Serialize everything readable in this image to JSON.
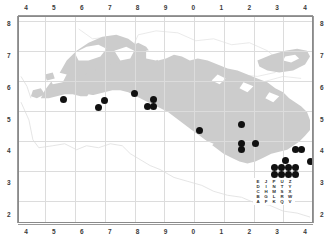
{
  "figure": {
    "kind": "distribution-dot-map",
    "background_color": "#ffffff",
    "landmass_color": "#cccccc",
    "coastline_color": "#d8d8d8",
    "grid_color": "#dcdcdc",
    "dot_color": "#111111",
    "frame_color": "#8a8a8a"
  },
  "axes": {
    "top_ticks": [
      "4",
      "5",
      "6",
      "7",
      "8",
      "9",
      "0",
      "1",
      "2",
      "3",
      "4"
    ],
    "bottom_ticks": [
      "4",
      "5",
      "6",
      "7",
      "8",
      "9",
      "0",
      "1",
      "2",
      "3",
      "4"
    ],
    "left_ticks": [
      "8",
      "7",
      "6",
      "5",
      "4",
      "3",
      "2"
    ],
    "right_ticks": [
      "8",
      "7",
      "6",
      "5",
      "4",
      "3",
      "2"
    ]
  },
  "legend": {
    "name": "grid-letter-key",
    "rows": [
      [
        "E",
        "J",
        "P",
        "U",
        "Z"
      ],
      [
        "D",
        "I",
        "N",
        "T",
        "Y"
      ],
      [
        "C",
        "H",
        "M",
        "S",
        "X"
      ],
      [
        "B",
        "G",
        "L",
        "R",
        "W"
      ],
      [
        "A",
        "F",
        "K",
        "Q",
        "V"
      ]
    ]
  },
  "chart_data": {
    "type": "scatter",
    "title": "",
    "xlabel": "",
    "ylabel": "",
    "grid": true,
    "legend_position": "bottom-right",
    "xtick_labels": [
      "4",
      "5",
      "6",
      "7",
      "8",
      "9",
      "0",
      "1",
      "2",
      "3",
      "4"
    ],
    "ytick_labels": [
      "8",
      "7",
      "6",
      "5",
      "4",
      "3",
      "2"
    ],
    "xlim": [
      3.5,
      4.5
    ],
    "ylim": [
      1.5,
      8.5
    ],
    "series": [
      {
        "name": "occurrence-records",
        "marker": "filled-circle",
        "color": "#111111",
        "points": [
          {
            "xpx": 44,
            "ypx": 82
          },
          {
            "xpx": 85,
            "ypx": 83
          },
          {
            "xpx": 79,
            "ypx": 90
          },
          {
            "xpx": 115,
            "ypx": 76
          },
          {
            "xpx": 134,
            "ypx": 82
          },
          {
            "xpx": 128,
            "ypx": 89
          },
          {
            "xpx": 134,
            "ypx": 89
          },
          {
            "xpx": 180,
            "ypx": 113
          },
          {
            "xpx": 222,
            "ypx": 107
          },
          {
            "xpx": 222,
            "ypx": 126
          },
          {
            "xpx": 236,
            "ypx": 126
          },
          {
            "xpx": 222,
            "ypx": 132
          },
          {
            "xpx": 276,
            "ypx": 132
          },
          {
            "xpx": 282,
            "ypx": 132
          },
          {
            "xpx": 306,
            "ypx": 120
          },
          {
            "xpx": 306,
            "ypx": 127
          },
          {
            "xpx": 306,
            "ypx": 139
          },
          {
            "xpx": 291,
            "ypx": 144
          },
          {
            "xpx": 266,
            "ypx": 143
          },
          {
            "xpx": 255,
            "ypx": 150
          },
          {
            "xpx": 262,
            "ypx": 150
          },
          {
            "xpx": 269,
            "ypx": 150
          },
          {
            "xpx": 276,
            "ypx": 150
          },
          {
            "xpx": 255,
            "ypx": 157
          },
          {
            "xpx": 262,
            "ypx": 157
          },
          {
            "xpx": 269,
            "ypx": 157
          },
          {
            "xpx": 276,
            "ypx": 157
          },
          {
            "xpx": 262,
            "ypx": 164
          },
          {
            "xpx": 269,
            "ypx": 164
          }
        ]
      }
    ]
  }
}
